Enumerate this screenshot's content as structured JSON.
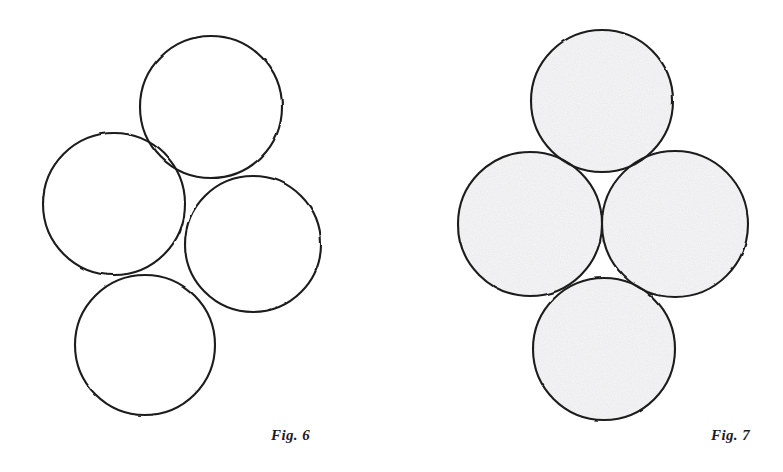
{
  "plate": {
    "background_color": "#ffffff",
    "width": 783,
    "height": 472,
    "ink_color": "#1c1c1c"
  },
  "figures": [
    {
      "id": "figure-6",
      "caption": "Fig. 6",
      "caption_position": {
        "x": 271,
        "y": 428
      },
      "panel": {
        "x": 0,
        "y": 0,
        "width": 391,
        "height": 472
      },
      "fill_style": "none",
      "fill_color": "#ffffff",
      "stroke_color": "#1c1c1c",
      "stroke_width": 2.1,
      "arrangement": "tilted-rhombus-cluster",
      "circle_count": 4,
      "circles": [
        {
          "name": "top-circle",
          "cx": 211,
          "cy": 107,
          "r": 71
        },
        {
          "name": "left-circle",
          "cx": 114,
          "cy": 204,
          "r": 71
        },
        {
          "name": "right-circle",
          "cx": 253,
          "cy": 244,
          "r": 68
        },
        {
          "name": "bottom-circle",
          "cx": 145,
          "cy": 345,
          "r": 70
        }
      ]
    },
    {
      "id": "figure-7",
      "caption": "Fig. 7",
      "caption_position": {
        "x": 320,
        "y": 428
      },
      "panel": {
        "x": 391,
        "y": 0,
        "width": 392,
        "height": 472
      },
      "fill_style": "stippled-light-gray",
      "fill_color": "#f7f7f8",
      "stroke_color": "#1c1c1c",
      "stroke_width": 2.1,
      "arrangement": "upright-symmetric-rosette",
      "circle_count": 4,
      "circles": [
        {
          "name": "top-circle",
          "cx": 211,
          "cy": 101,
          "r": 71
        },
        {
          "name": "left-circle",
          "cx": 139,
          "cy": 224,
          "r": 72
        },
        {
          "name": "right-circle",
          "cx": 284,
          "cy": 224,
          "r": 73
        },
        {
          "name": "bottom-circle",
          "cx": 213,
          "cy": 349,
          "r": 71
        }
      ]
    }
  ]
}
